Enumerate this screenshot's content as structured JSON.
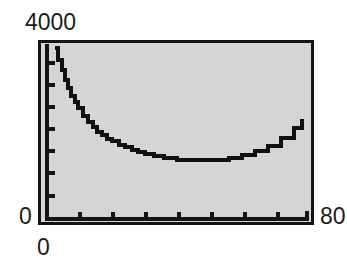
{
  "figure": {
    "background_color": "#ffffff",
    "plot_background_color": "#d5d5d5",
    "frame_color": "#141414",
    "curve_color": "#111111",
    "text_color": "#1a1a1a"
  },
  "labels": {
    "y_max": "4000",
    "y_min": "0",
    "x_min": "0",
    "x_max": "80"
  },
  "chart_data": {
    "type": "line",
    "title": "",
    "xlabel": "",
    "ylabel": "",
    "xlim": [
      0,
      80
    ],
    "ylim": [
      0,
      4000
    ],
    "x_tick_labels": [
      "0",
      "80"
    ],
    "y_tick_labels": [
      "0",
      "4000"
    ],
    "x_tick_count_interior": 7,
    "y_tick_count_interior": 7,
    "x_tick_step": 10,
    "y_tick_step": 500,
    "grid": false,
    "legend": null,
    "series": [
      {
        "name": "curve",
        "x": [
          2.5,
          3.5,
          4.5,
          5.5,
          6.5,
          7.5,
          8.5,
          9.5,
          11,
          12.5,
          14,
          15.5,
          17,
          18.5,
          20,
          22,
          24,
          26,
          28,
          30,
          33,
          36,
          40,
          44,
          48,
          52,
          56,
          60,
          64,
          68,
          72,
          76,
          78.5
        ],
        "y": [
          3900,
          3640,
          3400,
          3180,
          2990,
          2820,
          2670,
          2540,
          2360,
          2220,
          2100,
          2000,
          1910,
          1840,
          1780,
          1700,
          1640,
          1580,
          1530,
          1490,
          1440,
          1400,
          1360,
          1350,
          1350,
          1360,
          1400,
          1460,
          1550,
          1680,
          1850,
          2080,
          2290
        ]
      }
    ]
  }
}
